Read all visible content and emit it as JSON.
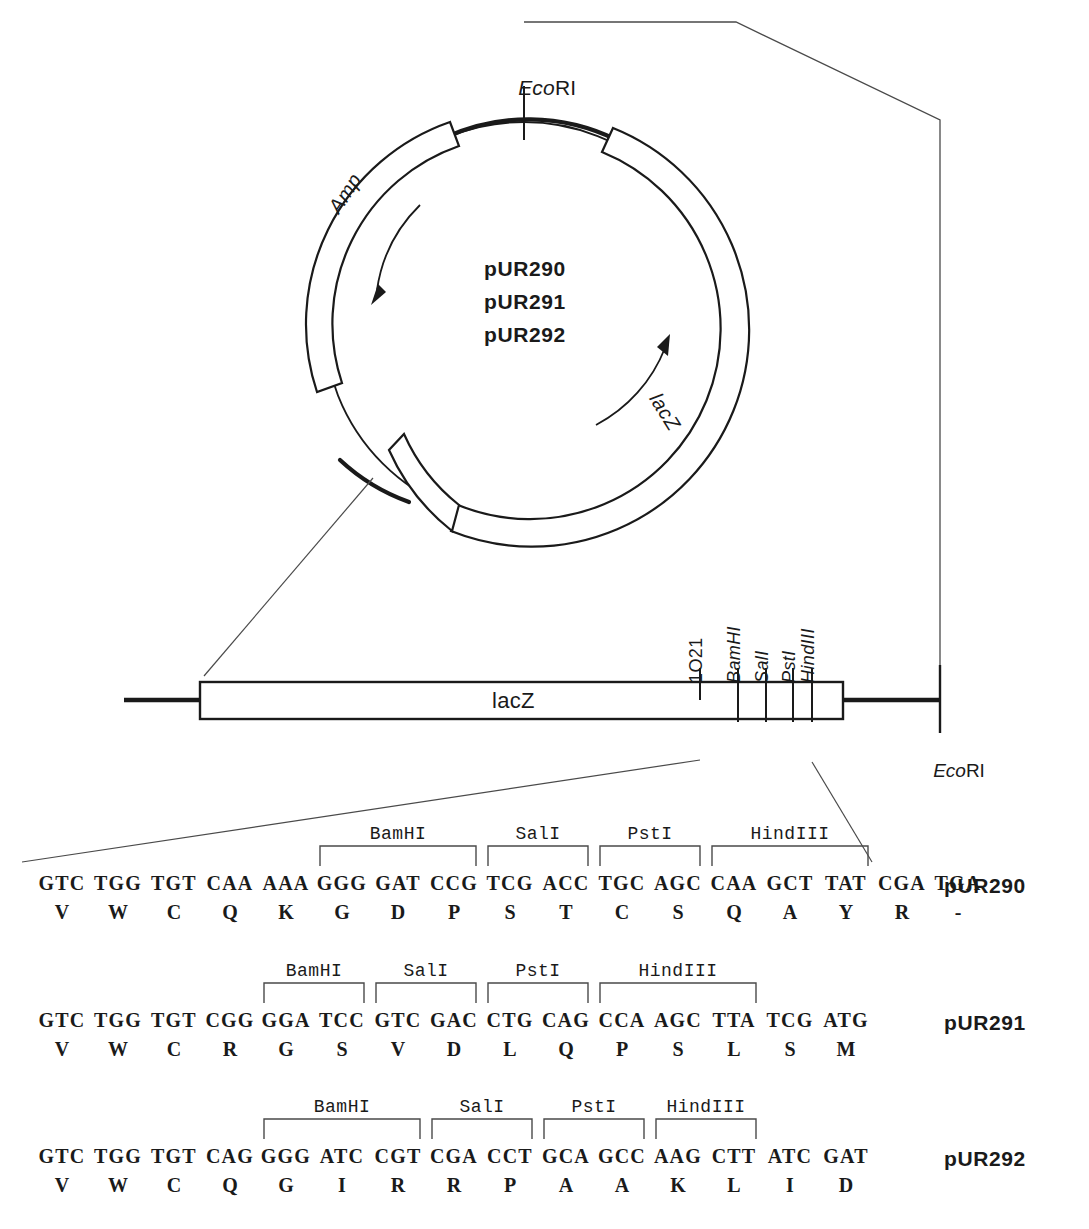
{
  "figure": {
    "type": "plasmid-map-and-polylinker-sequences",
    "plasmid_names": [
      "pUR290",
      "pUR291",
      "pUR292"
    ]
  },
  "plasmid_map": {
    "ecori_label": "EcoRI",
    "ecori_italic_part": "Eco",
    "ecori_roman_part": "RI",
    "amp_label": "Amp",
    "lacz_label": "lacZ",
    "center_lines": [
      "pUR290",
      "pUR291",
      "pUR292"
    ]
  },
  "linear_map": {
    "gene_box_label": "lacZ",
    "ecori_label": "EcoRI",
    "ecori_italic_part": "Eco",
    "ecori_roman_part": "RI",
    "sites": [
      {
        "label": "1O21",
        "italic": false,
        "x": 700
      },
      {
        "label": "BamHI",
        "italic": true,
        "x": 738
      },
      {
        "label": "SalI",
        "italic": true,
        "x": 766
      },
      {
        "label": "PstI",
        "italic": true,
        "x": 793
      },
      {
        "label": "HindIII",
        "italic": true,
        "x": 812
      }
    ]
  },
  "sequences": [
    {
      "name": "pUR290",
      "codons": [
        "GTC",
        "TGG",
        "TGT",
        "CAA",
        "AAA",
        "GGG",
        "GAT",
        "CCG",
        "TCG",
        "ACC",
        "TGC",
        "AGC",
        "CAA",
        "GCT",
        "TAT",
        "CGA",
        "TGA"
      ],
      "amino_acids": [
        "V",
        "W",
        "C",
        "Q",
        "K",
        "G",
        "D",
        "P",
        "S",
        "T",
        "C",
        "S",
        "Q",
        "A",
        "Y",
        "R",
        "-"
      ],
      "enzymes": [
        {
          "label": "BamHI",
          "start": 5,
          "end": 7
        },
        {
          "label": "SalI",
          "start": 8,
          "end": 9
        },
        {
          "label": "PstI",
          "start": 10,
          "end": 11
        },
        {
          "label": "HindIII",
          "start": 12,
          "end": 14
        }
      ]
    },
    {
      "name": "pUR291",
      "codons": [
        "GTC",
        "TGG",
        "TGT",
        "CGG",
        "GGA",
        "TCC",
        "GTC",
        "GAC",
        "CTG",
        "CAG",
        "CCA",
        "AGC",
        "TTA",
        "TCG",
        "ATG"
      ],
      "amino_acids": [
        "V",
        "W",
        "C",
        "R",
        "G",
        "S",
        "V",
        "D",
        "L",
        "Q",
        "P",
        "S",
        "L",
        "S",
        "M"
      ],
      "enzymes": [
        {
          "label": "BamHI",
          "start": 4,
          "end": 5
        },
        {
          "label": "SalI",
          "start": 6,
          "end": 7
        },
        {
          "label": "PstI",
          "start": 8,
          "end": 9
        },
        {
          "label": "HindIII",
          "start": 10,
          "end": 12
        }
      ]
    },
    {
      "name": "pUR292",
      "codons": [
        "GTC",
        "TGG",
        "TGT",
        "CAG",
        "GGG",
        "ATC",
        "CGT",
        "CGA",
        "CCT",
        "GCA",
        "GCC",
        "AAG",
        "CTT",
        "ATC",
        "GAT"
      ],
      "amino_acids": [
        "V",
        "W",
        "C",
        "Q",
        "G",
        "I",
        "R",
        "R",
        "P",
        "A",
        "A",
        "K",
        "L",
        "I",
        "D"
      ],
      "enzymes": [
        {
          "label": "BamHI",
          "start": 4,
          "end": 6
        },
        {
          "label": "SalI",
          "start": 7,
          "end": 8
        },
        {
          "label": "PstI",
          "start": 9,
          "end": 10
        },
        {
          "label": "HindIII",
          "start": 11,
          "end": 12
        }
      ]
    }
  ],
  "colors": {
    "ink": "#1a1a1a",
    "thin": "#555555",
    "background": "#ffffff"
  }
}
